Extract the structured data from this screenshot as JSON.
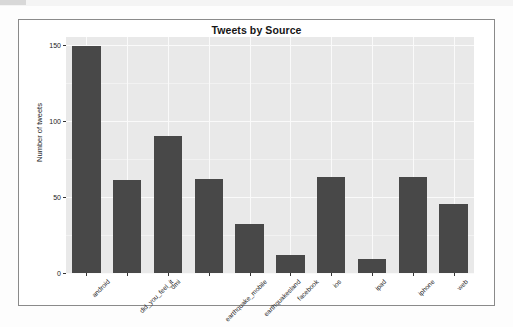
{
  "chart_data": {
    "type": "bar",
    "title": "Tweets by Source",
    "xlabel": "",
    "ylabel": "Number of tweets",
    "categories": [
      "android",
      "did_you_feel_it",
      "dmi",
      "earthquake_mobile",
      "earthquakesland",
      "facebook",
      "ios",
      "ipad",
      "iphone",
      "web"
    ],
    "values": [
      149,
      61,
      90,
      62,
      32,
      12,
      63,
      9,
      63,
      45
    ],
    "ylim": [
      0,
      155
    ],
    "yticks": [
      0,
      50,
      100,
      150
    ],
    "ytick_labels": [
      "0",
      "50",
      "100",
      "150"
    ],
    "grid": true,
    "legend": "none",
    "bar_color": "#484848",
    "panel_color": "#e9e9e9",
    "gridline_color": "#fafafa"
  },
  "figure": {
    "frame_border_color": "#8a8a8a",
    "background_color": "#ffffff"
  }
}
